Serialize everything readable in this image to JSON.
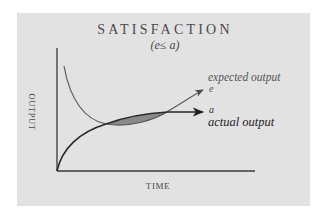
{
  "diagram": {
    "title": "SATISFACTION",
    "subtitle": "(e≤ a)",
    "y_axis_label": "OUTPUT",
    "x_axis_label": "TIME",
    "curves": {
      "expected": {
        "label": "expected output",
        "symbol": "e",
        "shape": "decreasing then rising arrow"
      },
      "actual": {
        "label": "actual output",
        "symbol": "a",
        "shape": "concave rising from origin, leveling to horizontal arrow"
      }
    },
    "shaded_region": "area where actual output exceeds expected output (between the two intersections)",
    "colors": {
      "card_background": "#e2e2e2",
      "page_background": "#ffffff",
      "axis": "#3a3a3a",
      "expected_curve": "#5a5a5a",
      "actual_curve": "#2a2a2a",
      "shaded_fill": "#8a8a8a"
    }
  }
}
